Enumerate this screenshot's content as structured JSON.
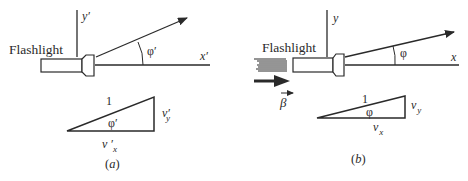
{
  "colors": {
    "ink": "#2a2a2a",
    "background": "#ffffff"
  },
  "panel_a": {
    "caption": "(a)",
    "flashlight_label": "Flashlight",
    "y_axis_label": "y′",
    "x_axis_label": "x′",
    "angle_label": "φ′",
    "triangle": {
      "hypotenuse_label": "1",
      "angle_label": "φ′",
      "vertical_label": "v′",
      "vertical_subscript": "y",
      "horizontal_label": "v ′",
      "horizontal_subscript": "x"
    }
  },
  "panel_b": {
    "caption": "(b)",
    "flashlight_label": "Flashlight",
    "y_axis_label": "y",
    "x_axis_label": "x",
    "angle_label": "φ",
    "velocity_label": "β",
    "triangle": {
      "hypotenuse_label": "1",
      "angle_label": "φ",
      "vertical_label": "v",
      "vertical_subscript": "y",
      "horizontal_label": "v",
      "horizontal_subscript": "x"
    }
  }
}
